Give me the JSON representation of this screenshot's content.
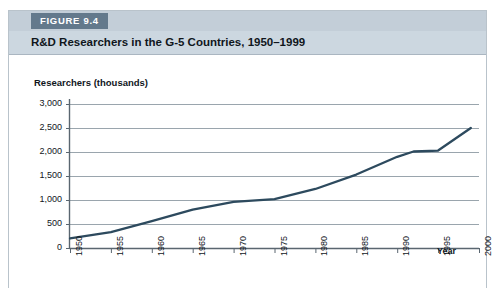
{
  "figure": {
    "tag": "FIGURE 9.4",
    "title": "R&D Researchers in the G-5 Countries, 1950–1999"
  },
  "chart_data": {
    "type": "line",
    "title": "R&D Researchers in the G-5 Countries, 1950–1999",
    "xlabel": "Year",
    "ylabel": "Researchers (thousands)",
    "xlim": [
      1950,
      2000
    ],
    "ylim": [
      0,
      3000
    ],
    "grid": true,
    "legend": null,
    "xticks": [
      "1950",
      "1955",
      "1960",
      "1965",
      "1970",
      "1975",
      "1980",
      "1985",
      "1990",
      "1995",
      "2000"
    ],
    "yticks": [
      "0",
      "500",
      "1,000",
      "1,500",
      "2,000",
      "2,500",
      "3,000"
    ],
    "ytick_values": [
      0,
      500,
      1000,
      1500,
      2000,
      2500,
      3000
    ],
    "xtick_values": [
      1950,
      1955,
      1960,
      1965,
      1970,
      1975,
      1980,
      1985,
      1990,
      1995,
      2000
    ],
    "line_color": "#2d4a5e",
    "series": [
      {
        "name": "R&D Researchers in the G-5 Countries",
        "x": [
          1950,
          1955,
          1960,
          1965,
          1970,
          1975,
          1980,
          1985,
          1990,
          1992,
          1995,
          1999
        ],
        "values": [
          200,
          330,
          560,
          800,
          960,
          1020,
          1230,
          1530,
          1900,
          2010,
          2030,
          2500
        ]
      }
    ]
  }
}
